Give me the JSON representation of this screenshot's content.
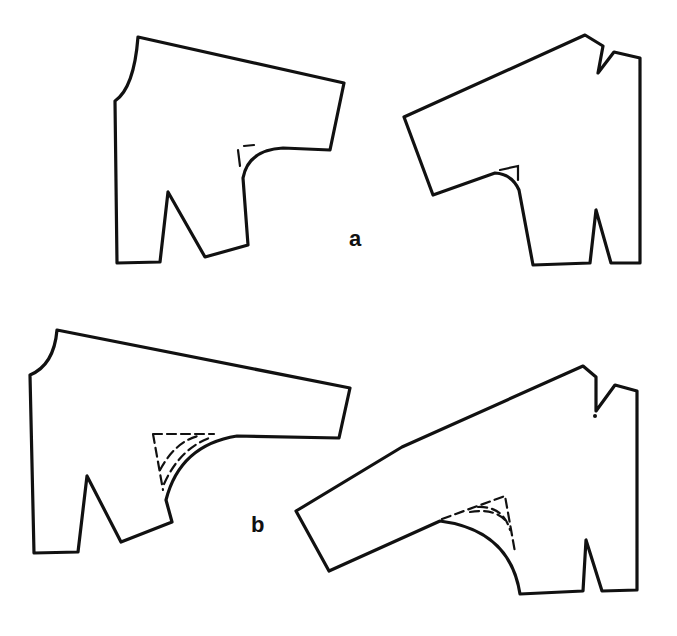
{
  "figure": {
    "type": "sewing pattern diagram",
    "labels": {
      "a": "a",
      "b": "b"
    },
    "pieces": [
      {
        "id": "a-back",
        "group": "a",
        "description": "back bodice with extended sleeve, small gusset mark at underarm"
      },
      {
        "id": "a-front",
        "group": "a",
        "description": "front bodice with extended sleeve, neck dart and waist dart, small gusset mark at underarm"
      },
      {
        "id": "b-back",
        "group": "b",
        "description": "back bodice with lowered sleeve, dashed gusset lines at underarm"
      },
      {
        "id": "b-front",
        "group": "b",
        "description": "front bodice with lowered sleeve, neck dart and waist dart, dashed gusset lines at underarm"
      }
    ],
    "colors": {
      "stroke": "#111111",
      "background": "#ffffff"
    }
  }
}
